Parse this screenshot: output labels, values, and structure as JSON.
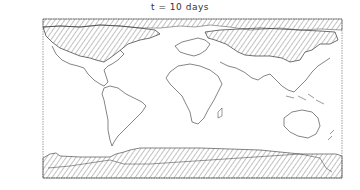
{
  "figure": {
    "title": "t = 10 days",
    "frame": {
      "x": 43,
      "y": 19,
      "width": 299,
      "height": 159
    },
    "legend": null
  },
  "map": {
    "projection": "equirectangular world map",
    "line_color": "#444444",
    "hatch_color": "#666666",
    "background": "#ffffff",
    "hatched_regions": [
      {
        "name": "arctic-north-america-greenland",
        "description": "Hatched area covering northern North America, Canadian Arctic and Greenland"
      },
      {
        "name": "northern-eurasia",
        "description": "Hatched area covering northern Europe and Siberia/northern Asia"
      },
      {
        "name": "arctic-ocean-band",
        "description": "Hatched band along top edge of map"
      },
      {
        "name": "antarctica-southern-ocean",
        "description": "Hatched band covering Antarctica and Southern Ocean at bottom"
      }
    ],
    "continents": [
      "North America",
      "South America",
      "Europe",
      "Africa",
      "Asia",
      "Australia",
      "Antarctica"
    ]
  }
}
